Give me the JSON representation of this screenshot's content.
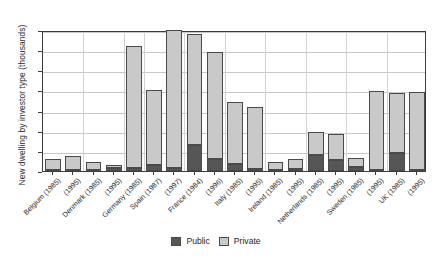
{
  "chart_data": {
    "type": "bar",
    "subtype": "stacked-vertical",
    "title": "",
    "xlabel": "",
    "ylabel": "New dwelling by investor type (thousands)",
    "ylim": [
      0,
      350
    ],
    "yticks": [
      0,
      50,
      100,
      150,
      200,
      250,
      300,
      350
    ],
    "grid": true,
    "legend_position": "bottom-center",
    "categories": [
      "Belgium (1985)",
      "(1995)",
      "Denmark (1985)",
      "(1995)",
      "Germany (1985)",
      "Spain (1987)",
      "(1997)",
      "France (1984)",
      "(1996)",
      "Italy (1985)",
      "(1995)",
      "Ireland (1985)",
      "(1995)",
      "Netherlands (1985)",
      "(1995)",
      "Sweden (1985)",
      "(1995)",
      "UK (1985)",
      "(1995)"
    ],
    "series": [
      {
        "name": "Public",
        "color": "#565656",
        "values": [
          2,
          2,
          2,
          8,
          7,
          16,
          7,
          65,
          30,
          17,
          6,
          2,
          4,
          40,
          28,
          11,
          3,
          45,
          3
        ]
      },
      {
        "name": "Private",
        "color": "#c9c9c9",
        "values": [
          28,
          36,
          21,
          7,
          303,
          185,
          343,
          276,
          266,
          154,
          153,
          21,
          27,
          57,
          64,
          22,
          196,
          149,
          194
        ]
      }
    ],
    "totals": [
      30,
      38,
      23,
      15,
      310,
      201,
      350,
      341,
      296,
      171,
      159,
      23,
      31,
      97,
      92,
      33,
      199,
      194,
      197
    ]
  },
  "legend": {
    "public_label": "Public",
    "private_label": "Private"
  }
}
